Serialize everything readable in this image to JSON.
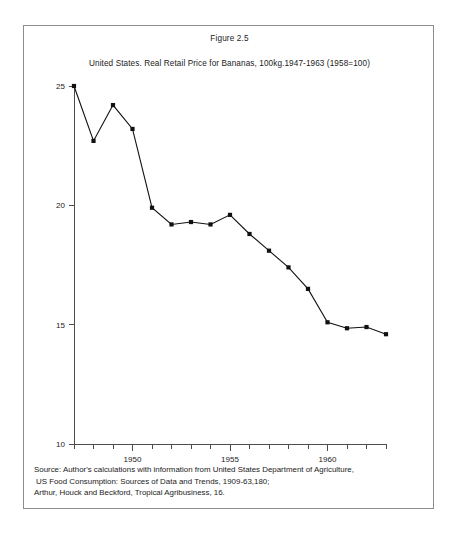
{
  "figure": {
    "caption": "Figure 2.5",
    "title": "United States. Real Retail Price for Bananas, 100kg.1947-1963 (1958=100)"
  },
  "source_note": {
    "line1": "Source: Author's calculations with information from United States Department of Agriculture,",
    "line2": "US Food Consumption: Sources of Data and Trends, 1909-63,180;",
    "line3": "Arthur, Houck and Beckford, Tropical Agribusiness, 16."
  },
  "chart_data": {
    "type": "line",
    "title": "United States. Real Retail Price for Bananas, 100kg.1947-1963 (1958=100)",
    "xlabel": "",
    "ylabel": "",
    "x": [
      1947,
      1948,
      1949,
      1950,
      1951,
      1952,
      1953,
      1954,
      1955,
      1956,
      1957,
      1958,
      1959,
      1960,
      1961,
      1962,
      1963
    ],
    "values": [
      25.0,
      22.7,
      24.2,
      23.2,
      19.9,
      19.2,
      19.3,
      19.2,
      19.6,
      18.8,
      18.1,
      17.4,
      16.5,
      15.1,
      14.85,
      14.9,
      14.6
    ],
    "xlim": [
      1947,
      1963
    ],
    "ylim": [
      10,
      25
    ],
    "y_ticks": [
      10,
      15,
      20,
      25
    ],
    "y_tick_labels": [
      "10",
      "15",
      "20",
      "25"
    ],
    "x_ticks": [
      1947,
      1948,
      1949,
      1950,
      1951,
      1952,
      1953,
      1954,
      1955,
      1956,
      1957,
      1958,
      1959,
      1960,
      1961,
      1962,
      1963
    ],
    "x_tick_labels_shown": [
      {
        "value": 1950,
        "label": "1950"
      },
      {
        "value": 1955,
        "label": "1955"
      },
      {
        "value": 1960,
        "label": "1960"
      }
    ],
    "grid": false,
    "legend": null,
    "marker": "square",
    "line_color": "#111111",
    "marker_color": "#111111",
    "axis_color": "#4d4d4d"
  }
}
